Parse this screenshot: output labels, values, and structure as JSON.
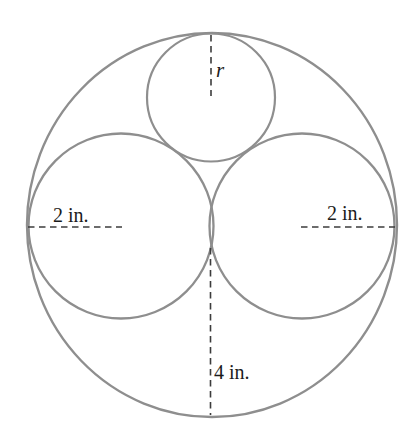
{
  "canvas": {
    "width": 417,
    "height": 446,
    "background": "#ffffff"
  },
  "colors": {
    "circle_stroke": "#8e8e8e",
    "dashed_line": "#3c3c3c",
    "label_text": "#1b1b1b"
  },
  "labels": {
    "small_circle_radius": "r",
    "left_circle_radius": "2 in.",
    "right_circle_radius": "2 in.",
    "large_circle_radius": "4 in."
  }
}
